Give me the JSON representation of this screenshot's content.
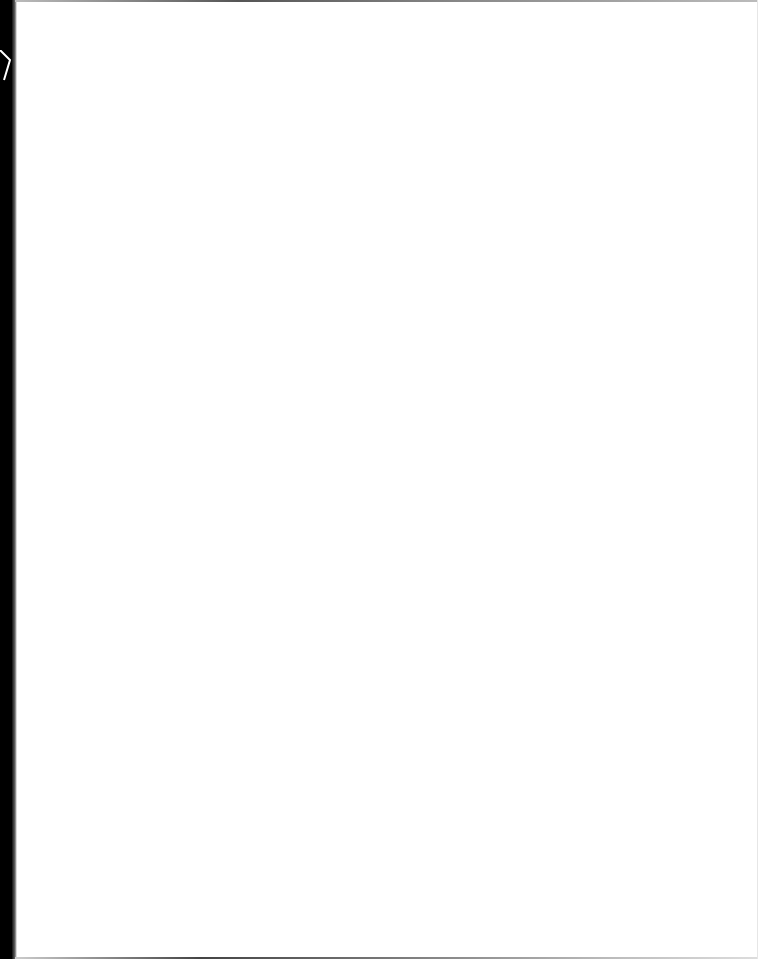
{
  "document": {
    "type": "scanned-page",
    "content": "",
    "colors": {
      "page": "#ffffff",
      "border_left": "#000000",
      "edge_shadow": "#555555"
    }
  }
}
